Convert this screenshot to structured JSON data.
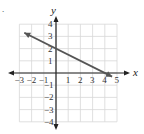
{
  "problem_marker": ".",
  "chart_data": {
    "type": "line",
    "title": "",
    "xlabel": "x",
    "ylabel": "y",
    "xlim": [
      -3,
      5
    ],
    "ylim": [
      -4,
      4
    ],
    "grid": true,
    "x_ticks": [
      "-3",
      "-2",
      "-1",
      "1",
      "2",
      "3",
      "4",
      "5"
    ],
    "y_ticks": [
      "4",
      "3",
      "2",
      "1",
      "-1",
      "-2",
      "-3",
      "-4"
    ],
    "series": [
      {
        "name": "line",
        "equation": "y = -x/2 + 2",
        "x": [
          -2.6,
          4.6
        ],
        "y": [
          3.3,
          -0.3
        ],
        "arrow_start": true,
        "arrow_end": true
      }
    ],
    "points": [
      {
        "label": "y-intercept",
        "x": 0,
        "y": 2
      },
      {
        "label": "x-intercept",
        "x": 4,
        "y": 0
      }
    ]
  }
}
